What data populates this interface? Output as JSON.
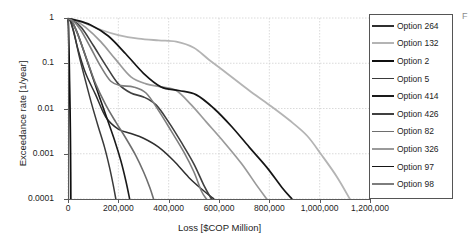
{
  "chart_data": {
    "type": "line",
    "title": "",
    "xlabel": "Loss [$COP Million]",
    "ylabel": "Exceedance rate [1/year]",
    "yscale": "log",
    "xscale": "linear",
    "xlim": [
      0,
      1200000
    ],
    "ylim": [
      0.0001,
      1
    ],
    "grid": true,
    "legend_position": "right",
    "xticks": [
      "0",
      "200,000",
      "400,000",
      "600,000",
      "800,000",
      "1,000,000",
      "1,200,000"
    ],
    "xtick_values": [
      0,
      200000,
      400000,
      600000,
      800000,
      1000000,
      1200000
    ],
    "yticks": [
      "1",
      "0.1",
      "0.01",
      "0.001",
      "0.0001"
    ],
    "ytick_values": [
      1,
      0.1,
      0.01,
      0.001,
      0.0001
    ],
    "series": [
      {
        "name": "Option 264",
        "color": "#2f2f2f",
        "width": 1.5,
        "points": [
          [
            0,
            0.95
          ],
          [
            8000,
            0.9
          ],
          [
            20000,
            0.55
          ],
          [
            40000,
            0.2
          ],
          [
            70000,
            0.06
          ],
          [
            110000,
            0.02
          ],
          [
            150000,
            0.0065
          ],
          [
            200000,
            0.0035
          ],
          [
            250000,
            0.0028
          ],
          [
            300000,
            0.0022
          ],
          [
            360000,
            0.0014
          ],
          [
            420000,
            0.0007
          ],
          [
            480000,
            0.0003
          ],
          [
            540000,
            0.00015
          ],
          [
            580000,
            0.0001
          ]
        ]
      },
      {
        "name": "Option 132",
        "color": "#b4b4b4",
        "width": 1.8,
        "points": [
          [
            0,
            0.96
          ],
          [
            15000,
            0.93
          ],
          [
            60000,
            0.8
          ],
          [
            130000,
            0.55
          ],
          [
            200000,
            0.42
          ],
          [
            280000,
            0.35
          ],
          [
            360000,
            0.32
          ],
          [
            430000,
            0.3
          ],
          [
            500000,
            0.22
          ],
          [
            560000,
            0.12
          ],
          [
            640000,
            0.055
          ],
          [
            720000,
            0.025
          ],
          [
            800000,
            0.012
          ],
          [
            880000,
            0.0055
          ],
          [
            950000,
            0.0025
          ],
          [
            1010000,
            0.0009
          ],
          [
            1070000,
            0.0003
          ],
          [
            1120000,
            0.0001
          ]
        ]
      },
      {
        "name": "Option 2",
        "color": "#101010",
        "width": 1.8,
        "points": [
          [
            0,
            0.97
          ],
          [
            2000,
            0.6
          ],
          [
            4000,
            0.18
          ],
          [
            6000,
            0.04
          ],
          [
            8000,
            0.01
          ],
          [
            9500,
            0.002
          ],
          [
            10500,
            0.0004
          ],
          [
            11000,
            0.0001
          ]
        ]
      },
      {
        "name": "Option 5",
        "color": "#3a3a3a",
        "width": 1.5,
        "points": [
          [
            0,
            0.95
          ],
          [
            10000,
            0.85
          ],
          [
            25000,
            0.45
          ],
          [
            45000,
            0.14
          ],
          [
            70000,
            0.04
          ],
          [
            95000,
            0.012
          ],
          [
            120000,
            0.004
          ],
          [
            145000,
            0.0014
          ],
          [
            165000,
            0.0005
          ],
          [
            180000,
            0.0002
          ],
          [
            190000,
            0.0001
          ]
        ]
      },
      {
        "name": "Option 414",
        "color": "#1a1a1a",
        "width": 1.6,
        "points": [
          [
            0,
            0.95
          ],
          [
            12000,
            0.88
          ],
          [
            35000,
            0.5
          ],
          [
            65000,
            0.17
          ],
          [
            95000,
            0.055
          ],
          [
            125000,
            0.018
          ],
          [
            155000,
            0.006
          ],
          [
            185000,
            0.002
          ],
          [
            210000,
            0.0007
          ],
          [
            230000,
            0.00025
          ],
          [
            245000,
            0.0001
          ]
        ]
      },
      {
        "name": "Option 426",
        "color": "#404040",
        "width": 1.6,
        "points": [
          [
            0,
            0.95
          ],
          [
            20000,
            0.9
          ],
          [
            55000,
            0.6
          ],
          [
            100000,
            0.25
          ],
          [
            150000,
            0.09
          ],
          [
            200000,
            0.035
          ],
          [
            250000,
            0.022
          ],
          [
            300000,
            0.018
          ],
          [
            350000,
            0.012
          ],
          [
            400000,
            0.005
          ],
          [
            450000,
            0.0018
          ],
          [
            500000,
            0.0006
          ],
          [
            540000,
            0.0002
          ],
          [
            570000,
            0.0001
          ]
        ]
      },
      {
        "name": "Option 82",
        "color": "#6e6e6e",
        "width": 1.6,
        "points": [
          [
            0,
            0.95
          ],
          [
            15000,
            0.87
          ],
          [
            40000,
            0.42
          ],
          [
            75000,
            0.12
          ],
          [
            110000,
            0.035
          ],
          [
            150000,
            0.012
          ],
          [
            190000,
            0.005
          ],
          [
            230000,
            0.0022
          ],
          [
            270000,
            0.0009
          ],
          [
            300000,
            0.0004
          ],
          [
            325000,
            0.00018
          ],
          [
            340000,
            0.0001
          ]
        ]
      },
      {
        "name": "Option 326",
        "color": "#9a9a9a",
        "width": 1.7,
        "points": [
          [
            0,
            0.95
          ],
          [
            25000,
            0.9
          ],
          [
            70000,
            0.62
          ],
          [
            130000,
            0.3
          ],
          [
            190000,
            0.12
          ],
          [
            250000,
            0.05
          ],
          [
            310000,
            0.035
          ],
          [
            370000,
            0.03
          ],
          [
            430000,
            0.025
          ],
          [
            490000,
            0.012
          ],
          [
            550000,
            0.005
          ],
          [
            620000,
            0.0018
          ],
          [
            690000,
            0.0006
          ],
          [
            750000,
            0.0002
          ],
          [
            790000,
            0.0001
          ]
        ]
      },
      {
        "name": "Option 97",
        "color": "#151515",
        "width": 1.7,
        "points": [
          [
            0,
            0.96
          ],
          [
            30000,
            0.9
          ],
          [
            90000,
            0.7
          ],
          [
            160000,
            0.4
          ],
          [
            230000,
            0.16
          ],
          [
            300000,
            0.06
          ],
          [
            370000,
            0.03
          ],
          [
            440000,
            0.025
          ],
          [
            510000,
            0.02
          ],
          [
            580000,
            0.01
          ],
          [
            650000,
            0.004
          ],
          [
            720000,
            0.0014
          ],
          [
            790000,
            0.0005
          ],
          [
            850000,
            0.00018
          ],
          [
            890000,
            0.0001
          ]
        ]
      },
      {
        "name": "Option 98",
        "color": "#7d7d7d",
        "width": 1.6,
        "points": [
          [
            0,
            0.95
          ],
          [
            18000,
            0.88
          ],
          [
            50000,
            0.55
          ],
          [
            90000,
            0.22
          ],
          [
            130000,
            0.085
          ],
          [
            170000,
            0.04
          ],
          [
            210000,
            0.032
          ],
          [
            260000,
            0.03
          ],
          [
            310000,
            0.022
          ],
          [
            360000,
            0.009
          ],
          [
            410000,
            0.0032
          ],
          [
            460000,
            0.0011
          ],
          [
            500000,
            0.0004
          ],
          [
            530000,
            0.00015
          ],
          [
            550000,
            0.0001
          ]
        ]
      }
    ]
  },
  "legend": {
    "items": [
      {
        "label": "Option 264"
      },
      {
        "label": "Option 132"
      },
      {
        "label": "Option 2"
      },
      {
        "label": "Option 5"
      },
      {
        "label": "Option 414"
      },
      {
        "label": "Option 426"
      },
      {
        "label": "Option 82"
      },
      {
        "label": "Option 326"
      },
      {
        "label": "Option 97"
      },
      {
        "label": "Option 98"
      }
    ]
  },
  "edge_artifact": "F"
}
